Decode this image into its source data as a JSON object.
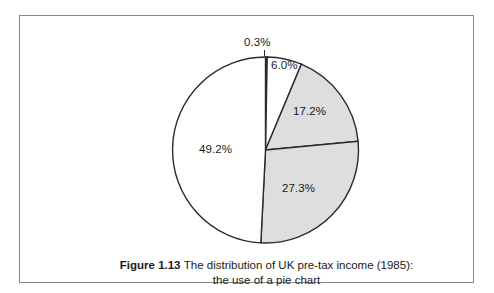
{
  "figure": {
    "number_label": "Figure 1.13",
    "caption_line1": "The distribution of UK pre-tax income (1985):",
    "caption_line2": "the use of a pie chart",
    "frame_color": "#8a8a8a",
    "background_color": "#ffffff"
  },
  "chart_data": {
    "type": "pie",
    "title": "The distribution of UK pre-tax income (1985)",
    "subtitle": "the use of a pie chart",
    "unit": "%",
    "total": 100.0,
    "start_angle_deg": 0,
    "direction": "clockwise",
    "grid": false,
    "legend": "none",
    "labels_inside": true,
    "categories": [
      "0.3%",
      "6.0%",
      "17.2%",
      "27.3%",
      "49.2%"
    ],
    "values": [
      0.3,
      6.0,
      17.2,
      27.3,
      49.2
    ],
    "slices": [
      {
        "label": "0.3%",
        "value": 0.3,
        "fill": "#555555",
        "stroke": "#2b2b2b",
        "label_position": "outside-top"
      },
      {
        "label": "6.0%",
        "value": 6.0,
        "fill": "#ffffff",
        "stroke": "#2b2b2b",
        "label_position": "inside"
      },
      {
        "label": "17.2%",
        "value": 17.2,
        "fill": "#dedede",
        "stroke": "#2b2b2b",
        "label_position": "inside"
      },
      {
        "label": "27.3%",
        "value": 27.3,
        "fill": "#dedede",
        "stroke": "#2b2b2b",
        "label_position": "inside"
      },
      {
        "label": "49.2%",
        "value": 49.2,
        "fill": "#ffffff",
        "stroke": "#2b2b2b",
        "label_position": "inside"
      }
    ]
  }
}
